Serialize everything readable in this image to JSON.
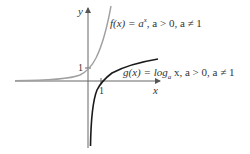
{
  "diagram": {
    "axes": {
      "x_label": "x",
      "y_label": "y"
    },
    "ticks": {
      "x_one": "1",
      "y_one": "1"
    },
    "curves": [
      {
        "name": "f",
        "label": "f(x) = a^x, a > 0, a ≠ 1",
        "label_parts": {
          "lhs": "f(x) = a",
          "sup": "x",
          "rest": ", a > 0, a ≠ 1"
        },
        "color": "#a0a0a0"
      },
      {
        "name": "g",
        "label": "g(x) = log_a x, a > 0, a ≠ 1",
        "label_parts": {
          "lhs": "g(x) = log",
          "sub": "a",
          "rest": " x, a > 0, a ≠ 1"
        },
        "color": "#1a1a1a"
      }
    ]
  }
}
